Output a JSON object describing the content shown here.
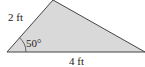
{
  "figure": {
    "type": "triangle",
    "fill_color": "#d9d9d9",
    "stroke_color": "#444444",
    "sides": {
      "left_side_label": "2 ft",
      "base_label": "4 ft"
    },
    "angle": {
      "label": "50°",
      "vertex": "bottom-left"
    }
  }
}
